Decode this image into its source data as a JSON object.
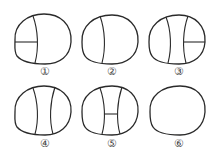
{
  "figure": {
    "stroke_color": "#2a2a2a",
    "label_color": "#444444",
    "items": [
      {
        "label": "①",
        "dividers": "left vertical curve with horizontal line on left segment"
      },
      {
        "label": "②",
        "dividers": "single left vertical curve"
      },
      {
        "label": "③",
        "dividers": "two vertical curves with horizontal line on right segment"
      },
      {
        "label": "④",
        "dividers": "two vertical curves"
      },
      {
        "label": "⑤",
        "dividers": "two vertical curves joined by middle horizontal line"
      },
      {
        "label": "⑥",
        "dividers": "none"
      }
    ]
  }
}
